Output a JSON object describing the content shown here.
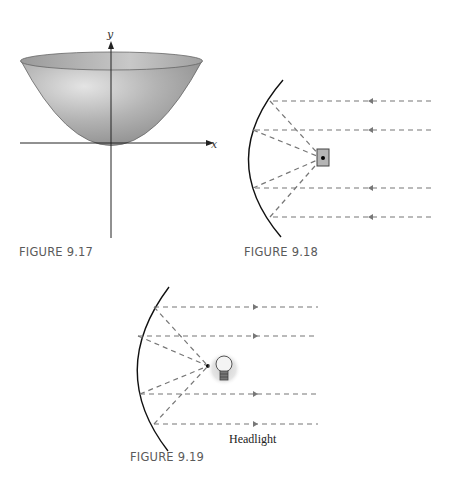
{
  "figures": [
    {
      "id": "fig-9-17",
      "caption": "FIGURE 9.17",
      "description": "Paraboloid surface with x and y axes",
      "axis_labels": {
        "x": "x",
        "y": "y"
      }
    },
    {
      "id": "fig-9-18",
      "caption": "FIGURE 9.18",
      "description": "Parabolic reflector collecting parallel incoming rays to a receiver at the focus"
    },
    {
      "id": "fig-9-19",
      "caption": "FIGURE 9.19",
      "description": "Parabolic reflector with a light bulb at the focus emitting parallel rays",
      "label": "Headlight"
    }
  ],
  "colors": {
    "surface": "#a9a9a9",
    "ray": "#777777",
    "mirror": "#111111",
    "caption": "#5a5a5a"
  }
}
